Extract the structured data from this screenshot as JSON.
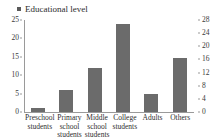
{
  "legend": {
    "marker_icon": "square-marker-icon",
    "label": "Educational level",
    "marker_color": "#5a5a5a"
  },
  "axes": {
    "left_ticks": [
      "25",
      "20",
      "15",
      "10",
      "5",
      "0"
    ],
    "right_ticks": [
      "28",
      "24",
      "20",
      "16",
      "12",
      "8",
      "4",
      "0"
    ]
  },
  "chart_data": {
    "type": "bar",
    "title": "",
    "subtitle": "",
    "xlabel": "",
    "ylabel": "",
    "grid": false,
    "legend_position": "top-left",
    "categories": [
      "Preschool students",
      "Primary school students",
      "Middle school students",
      "College students",
      "Adults",
      "Others"
    ],
    "series": [
      {
        "name": "Educational level",
        "color": "#6b6b6b",
        "values": [
          1,
          6,
          12,
          24,
          5,
          14.7
        ]
      }
    ],
    "ylim": [
      0,
      25
    ],
    "ytick_step": 5,
    "secondary_ylim": [
      0,
      28
    ],
    "secondary_ytick_step": 4,
    "secondary_axis_has_series": false
  }
}
